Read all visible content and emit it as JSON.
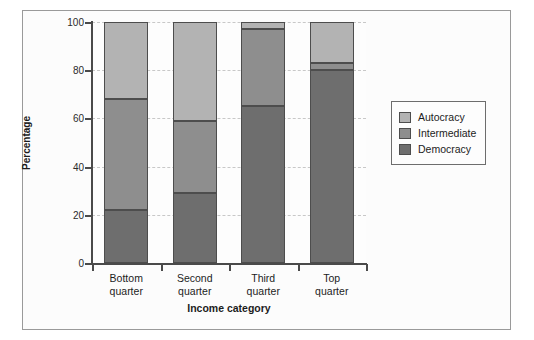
{
  "chart_data": {
    "type": "bar",
    "subtype": "stacked-100-percent",
    "title": "",
    "xlabel": "Income category",
    "ylabel": "Percentage",
    "categories": [
      "Bottom quarter",
      "Second quarter",
      "Third quarter",
      "Top quarter"
    ],
    "category_lines": [
      [
        "Bottom",
        "quarter"
      ],
      [
        "Second",
        "quarter"
      ],
      [
        "Third",
        "quarter"
      ],
      [
        "Top",
        "quarter"
      ]
    ],
    "series": [
      {
        "name": "Democracy",
        "color": "#6e6e6e",
        "values": [
          22,
          29,
          65,
          80
        ]
      },
      {
        "name": "Intermediate",
        "color": "#8e8e8e",
        "values": [
          46,
          30,
          32,
          3
        ]
      },
      {
        "name": "Autocracy",
        "color": "#b3b3b3",
        "values": [
          32,
          41,
          3,
          17
        ]
      }
    ],
    "cumulative_tops": {
      "Democracy": [
        22,
        29,
        65,
        80
      ],
      "Intermediate": [
        68,
        59,
        97,
        83
      ],
      "Autocracy": [
        100,
        100,
        100,
        100
      ]
    },
    "ylim": [
      0,
      100
    ],
    "yticks": [
      0,
      20,
      40,
      60,
      80,
      100
    ],
    "ytick_labels": [
      "0",
      "20",
      "40",
      "60",
      "80",
      "100"
    ],
    "grid": true,
    "grid_axis": "y",
    "legend_position": "right",
    "legend_entries": [
      "Autocracy",
      "Intermediate",
      "Democracy"
    ]
  },
  "legend": {
    "items": [
      {
        "label": "Autocracy",
        "color": "#b3b3b3"
      },
      {
        "label": "Intermediate",
        "color": "#8e8e8e"
      },
      {
        "label": "Democracy",
        "color": "#6e6e6e"
      }
    ]
  },
  "colors": {
    "autocracy": "#b3b3b3",
    "intermediate": "#8e8e8e",
    "democracy": "#6e6e6e",
    "axis": "#4a4a4a",
    "grid": "#c8c8c8",
    "frame": "#9a9a9a",
    "background": "#fcfcfc"
  }
}
